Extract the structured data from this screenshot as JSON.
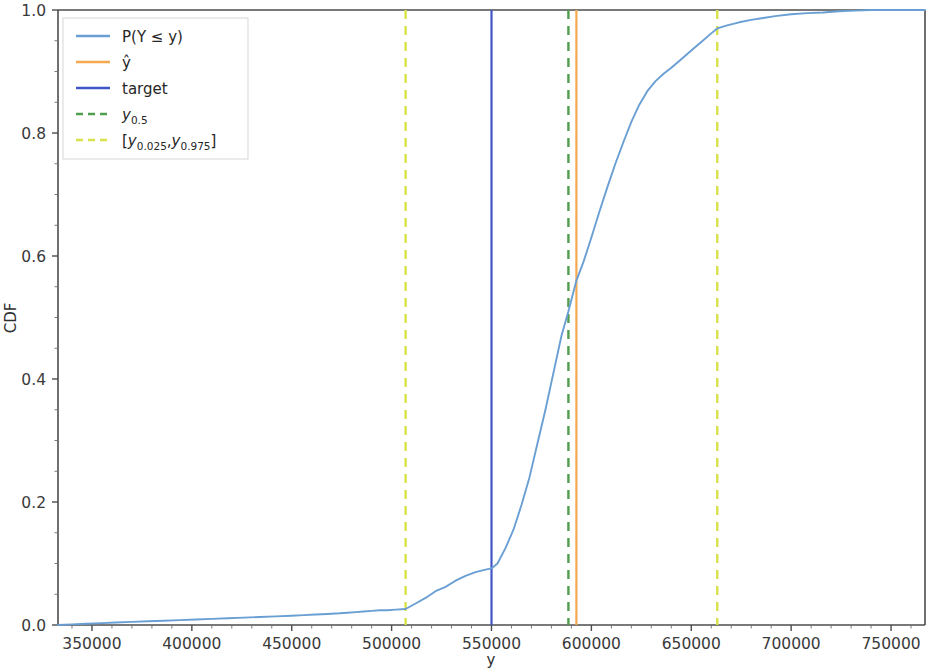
{
  "chart_data": {
    "type": "line",
    "title": "",
    "xlabel": "y",
    "ylabel": "CDF",
    "xlim": [
      333000,
      767000
    ],
    "ylim": [
      0.0,
      1.0
    ],
    "grid": false,
    "legend_position": "upper left",
    "x_ticks": [
      350000,
      500000,
      450000,
      500000,
      550000,
      600000,
      650000,
      700000,
      750000
    ],
    "x_tick_labels": [
      "350000",
      "400000",
      "450000",
      "500000",
      "550000",
      "600000",
      "650000",
      "700000",
      "750000"
    ],
    "x_tick_values": [
      350000,
      400000,
      450000,
      500000,
      550000,
      600000,
      650000,
      700000,
      750000
    ],
    "y_ticks": [
      0.0,
      0.2,
      0.4,
      0.6,
      0.8,
      1.0
    ],
    "y_tick_labels": [
      "0.0",
      "0.2",
      "0.4",
      "0.6",
      "0.8",
      "1.0"
    ],
    "legend": [
      {
        "label": "P(Y ≤ y)",
        "color": "#6a9fd4",
        "style": "solid",
        "name": "cdf-curve"
      },
      {
        "label": "ŷ",
        "color": "#f5a94e",
        "style": "solid",
        "name": "prediction-line"
      },
      {
        "label": "target",
        "color": "#4156c6",
        "style": "solid",
        "name": "target-line"
      },
      {
        "label_main": "y",
        "label_sub": "0.5",
        "label": "y0.5",
        "color": "#4f9e4f",
        "style": "dashed",
        "name": "median-line"
      },
      {
        "label_open": "[y",
        "label_sub1": "0.025",
        "label_mid": ", y",
        "label_sub2": "0.975",
        "label_close": "]",
        "label": "[y0.025, y0.975]",
        "color": "#d8e24a",
        "style": "dashed",
        "name": "interval-lines"
      }
    ],
    "vlines": [
      {
        "name": "lower-quantile",
        "x": 507000,
        "color": "#d8e24a",
        "style": "dashed"
      },
      {
        "name": "target",
        "x": 550000,
        "color": "#4156c6",
        "style": "solid"
      },
      {
        "name": "median",
        "x": 588500,
        "color": "#4f9e4f",
        "style": "dashed"
      },
      {
        "name": "prediction",
        "x": 592500,
        "color": "#f5a94e",
        "style": "solid"
      },
      {
        "name": "upper-quantile",
        "x": 663000,
        "color": "#d8e24a",
        "style": "dashed"
      }
    ],
    "series": [
      {
        "name": "P(Y ≤ y)",
        "color": "#6a9fd4",
        "x": [
          333000,
          340000,
          347000,
          355000,
          362000,
          370000,
          378000,
          386000,
          394000,
          402000,
          410000,
          418000,
          426000,
          434000,
          442000,
          450000,
          456000,
          462000,
          468000,
          474000,
          478000,
          482000,
          486000,
          490000,
          494000,
          498000,
          502000,
          507000,
          512000,
          517000,
          522000,
          527000,
          532000,
          537000,
          542000,
          547000,
          550000,
          553000,
          557000,
          561000,
          565000,
          569000,
          573000,
          577000,
          581000,
          585000,
          588500,
          592500,
          596000,
          600000,
          604000,
          608000,
          612000,
          616000,
          620000,
          624000,
          628000,
          632000,
          636000,
          640000,
          645000,
          650000,
          655000,
          660000,
          663000,
          668000,
          674000,
          680000,
          686000,
          692000,
          700000,
          708000,
          716000,
          724000,
          732000,
          740000,
          748000,
          760000,
          767000
        ],
        "y": [
          0.0,
          0.001,
          0.002,
          0.003,
          0.004,
          0.005,
          0.006,
          0.007,
          0.008,
          0.009,
          0.01,
          0.011,
          0.012,
          0.013,
          0.014,
          0.015,
          0.016,
          0.017,
          0.018,
          0.019,
          0.02,
          0.021,
          0.022,
          0.023,
          0.024,
          0.024,
          0.025,
          0.026,
          0.035,
          0.044,
          0.055,
          0.062,
          0.072,
          0.08,
          0.086,
          0.09,
          0.092,
          0.1,
          0.125,
          0.155,
          0.195,
          0.24,
          0.295,
          0.35,
          0.41,
          0.47,
          0.51,
          0.56,
          0.59,
          0.63,
          0.672,
          0.712,
          0.75,
          0.785,
          0.818,
          0.846,
          0.868,
          0.884,
          0.896,
          0.906,
          0.92,
          0.934,
          0.948,
          0.962,
          0.97,
          0.975,
          0.98,
          0.984,
          0.987,
          0.99,
          0.993,
          0.995,
          0.996,
          0.998,
          0.999,
          1.0,
          1.0,
          1.0,
          1.0
        ]
      }
    ],
    "annotations": {
      "cdf_at_target": 0.092,
      "cdf_at_lower_quantile": 0.025,
      "cdf_at_upper_quantile": 0.975,
      "cdf_at_median": 0.51
    }
  },
  "axes": {
    "x_title": "y",
    "y_title": "CDF"
  }
}
